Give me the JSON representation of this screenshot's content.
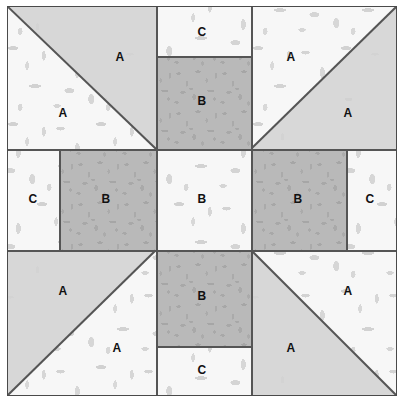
{
  "diagram": {
    "width": 405,
    "height": 403,
    "colors": {
      "solid_fabric": "#d8d8d8",
      "medium_print": "#b9b9b9",
      "light_print": "#f7f7f7",
      "seam_line": "#555555",
      "border": "#4a4a4a",
      "label_text": "#111111",
      "background": "#ffffff"
    },
    "grid": {
      "columns": 3,
      "rows": 3,
      "column_edges": [
        7,
        155,
        250,
        397
      ],
      "row_edges": [
        6,
        148,
        250,
        396
      ]
    }
  },
  "patches": [
    {
      "id": "tl-hst-upper",
      "label": "A",
      "fabric": "solid_fabric",
      "unit": "half-square-triangle",
      "position": "top-left",
      "label_x": 120,
      "label_y": 57
    },
    {
      "id": "tl-hst-lower",
      "label": "A",
      "fabric": "light_print",
      "unit": "half-square-triangle",
      "position": "top-left",
      "label_x": 63,
      "label_y": 113
    },
    {
      "id": "tc-strip-c",
      "label": "C",
      "fabric": "light_print",
      "unit": "rectangle",
      "position": "top-center",
      "label_x": 202,
      "label_y": 32
    },
    {
      "id": "tc-square-b",
      "label": "B",
      "fabric": "medium_print",
      "unit": "rectangle",
      "position": "top-center",
      "label_x": 202,
      "label_y": 101
    },
    {
      "id": "tr-hst-upper",
      "label": "A",
      "fabric": "light_print",
      "unit": "half-square-triangle",
      "position": "top-right",
      "label_x": 291,
      "label_y": 57
    },
    {
      "id": "tr-hst-lower",
      "label": "A",
      "fabric": "solid_fabric",
      "unit": "half-square-triangle",
      "position": "top-right",
      "label_x": 348,
      "label_y": 113
    },
    {
      "id": "ml-strip-c",
      "label": "C",
      "fabric": "light_print",
      "unit": "rectangle",
      "position": "middle-left",
      "label_x": 33,
      "label_y": 199
    },
    {
      "id": "ml-square-b",
      "label": "B",
      "fabric": "medium_print",
      "unit": "rectangle",
      "position": "middle-left",
      "label_x": 106,
      "label_y": 199
    },
    {
      "id": "center-b",
      "label": "B",
      "fabric": "light_print",
      "unit": "square",
      "position": "center",
      "label_x": 202,
      "label_y": 199
    },
    {
      "id": "mr-square-b",
      "label": "B",
      "fabric": "medium_print",
      "unit": "rectangle",
      "position": "middle-right",
      "label_x": 298,
      "label_y": 199
    },
    {
      "id": "mr-strip-c",
      "label": "C",
      "fabric": "light_print",
      "unit": "rectangle",
      "position": "middle-right",
      "label_x": 370,
      "label_y": 199
    },
    {
      "id": "bl-hst-upper",
      "label": "A",
      "fabric": "solid_fabric",
      "unit": "half-square-triangle",
      "position": "bottom-left",
      "label_x": 63,
      "label_y": 291
    },
    {
      "id": "bl-hst-lower",
      "label": "A",
      "fabric": "light_print",
      "unit": "half-square-triangle",
      "position": "bottom-left",
      "label_x": 117,
      "label_y": 348
    },
    {
      "id": "bc-square-b",
      "label": "B",
      "fabric": "medium_print",
      "unit": "rectangle",
      "position": "bottom-center",
      "label_x": 202,
      "label_y": 296
    },
    {
      "id": "bc-strip-c",
      "label": "C",
      "fabric": "light_print",
      "unit": "rectangle",
      "position": "bottom-center",
      "label_x": 202,
      "label_y": 370
    },
    {
      "id": "br-hst-upper",
      "label": "A",
      "fabric": "light_print",
      "unit": "half-square-triangle",
      "position": "bottom-right",
      "label_x": 348,
      "label_y": 291
    },
    {
      "id": "br-hst-lower",
      "label": "A",
      "fabric": "solid_fabric",
      "unit": "half-square-triangle",
      "position": "bottom-right",
      "label_x": 291,
      "label_y": 348
    }
  ]
}
